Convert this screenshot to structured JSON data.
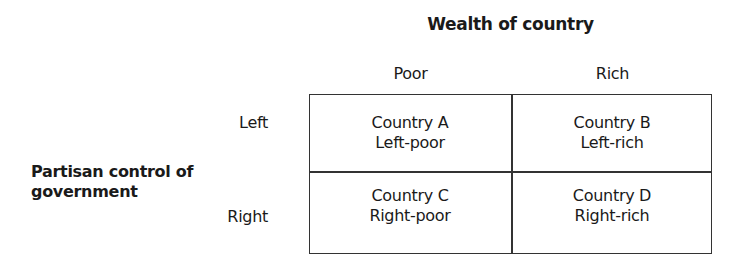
{
  "diagram": {
    "title": "Wealth of country",
    "columns": [
      "Poor",
      "Rich"
    ],
    "row_axis_label": [
      "Partisan control of",
      "government"
    ],
    "rows": [
      "Left",
      "Right"
    ],
    "cells": [
      [
        {
          "name": "Country A",
          "desc": "Left-poor"
        },
        {
          "name": "Country B",
          "desc": "Left-rich"
        }
      ],
      [
        {
          "name": "Country C",
          "desc": "Right-poor"
        },
        {
          "name": "Country D",
          "desc": "Right-rich"
        }
      ]
    ]
  }
}
